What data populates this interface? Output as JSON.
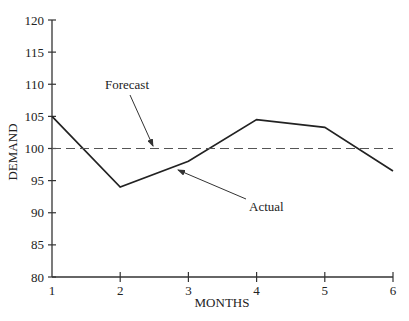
{
  "chart_data": {
    "type": "line",
    "title": "",
    "xlabel": "MONTHS",
    "ylabel": "DEMAND",
    "x": [
      1,
      2,
      3,
      4,
      5,
      6
    ],
    "x_tick_labels": [
      "1",
      "2",
      "3",
      "4",
      "5",
      "6"
    ],
    "y_tick_labels": [
      "80",
      "85",
      "90",
      "95",
      "100",
      "105",
      "110",
      "115",
      "120"
    ],
    "y_ticks": [
      80,
      85,
      90,
      95,
      100,
      105,
      110,
      115,
      120
    ],
    "xlim": [
      1,
      6
    ],
    "ylim": [
      80,
      120
    ],
    "grid": false,
    "legend": "none",
    "series": [
      {
        "name": "Actual",
        "style": "solid",
        "color": "#222222",
        "values": [
          105,
          94,
          98,
          104.5,
          103.3,
          96.5
        ]
      },
      {
        "name": "Forecast",
        "style": "dashed",
        "color": "#555555",
        "values": [
          100,
          100,
          100,
          100,
          100,
          100
        ]
      }
    ],
    "annotations": [
      {
        "text": "Forecast",
        "points_to": "Forecast",
        "target": [
          1.8,
          100
        ]
      },
      {
        "text": "Actual",
        "points_to": "Actual",
        "target": [
          2.8,
          97.2
        ]
      }
    ]
  },
  "labels": {
    "xlabel": "MONTHS",
    "ylabel": "DEMAND",
    "forecast": "Forecast",
    "actual": "Actual"
  }
}
